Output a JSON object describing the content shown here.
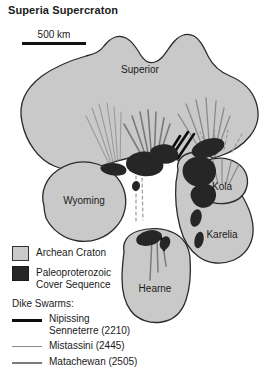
{
  "figure": {
    "title": "Superia Supercraton",
    "scale_bar": {
      "label": "500 km"
    }
  },
  "map": {
    "cratons": [
      {
        "name": "Superior",
        "label": "Superior"
      },
      {
        "name": "Wyoming",
        "label": "Wyoming"
      },
      {
        "name": "Hearne",
        "label": "Hearne"
      },
      {
        "name": "Kola",
        "label": "Kola"
      },
      {
        "name": "Karelia",
        "label": "Karelia"
      }
    ]
  },
  "legend": {
    "units": [
      {
        "key": "archean",
        "label": "Archean Craton",
        "color": "#c9c9c9"
      },
      {
        "key": "paleoproterozoic",
        "label": "Paleoproterozoic\nCover Sequence",
        "line1": "Paleoproterozoic",
        "line2": "Cover Sequence",
        "color": "#262626"
      }
    ],
    "dike_swarms": {
      "heading": "Dike Swarms:",
      "items": [
        {
          "key": "nipissing",
          "line1": "Nipissing",
          "line2": "Senneterre (2210)",
          "age": "2210",
          "color": "#0d0d0d"
        },
        {
          "key": "mistassini",
          "line1": "Mistassini (2445)",
          "line2": "",
          "age": "2445",
          "color": "#8a8a8a"
        },
        {
          "key": "matachewan",
          "line1": "Matachewan (2505)",
          "line2": "",
          "age": "2505",
          "color": "#7a7a7a"
        }
      ]
    }
  }
}
